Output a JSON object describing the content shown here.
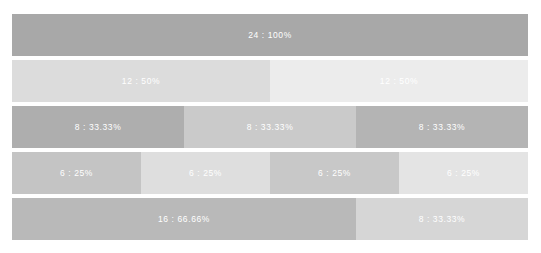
{
  "chart_data": {
    "type": "bar",
    "title": "",
    "subtitle": "",
    "xlabel": "",
    "ylabel": "",
    "orientation": "horizontal",
    "layout": "stacked-fraction-rows",
    "grid": false,
    "legend": null,
    "whole_value": 24,
    "background_color": "#ffffff",
    "label_color": "#ffffff",
    "row_gap_px": 4,
    "rows": [
      {
        "row_index": 0,
        "denominator": 1,
        "segments": [
          {
            "label": "24 : 100%",
            "value": 24,
            "percent": 100,
            "fraction": 1,
            "color": "#a8a8a8"
          }
        ]
      },
      {
        "row_index": 1,
        "denominator": 2,
        "segments": [
          {
            "label": "12 : 50%",
            "value": 12,
            "percent": 50,
            "fraction": 0.5,
            "color": "#dcdcdc"
          },
          {
            "label": "12 : 50%",
            "value": 12,
            "percent": 50,
            "fraction": 0.5,
            "color": "#ececec"
          }
        ]
      },
      {
        "row_index": 2,
        "denominator": 3,
        "segments": [
          {
            "label": "8 : 33.33%",
            "value": 8,
            "percent": 33.33,
            "fraction": 0.3333,
            "color": "#aeaeae"
          },
          {
            "label": "8 : 33.33%",
            "value": 8,
            "percent": 33.33,
            "fraction": 0.3333,
            "color": "#cacaca"
          },
          {
            "label": "8 : 33.33%",
            "value": 8,
            "percent": 33.33,
            "fraction": 0.3333,
            "color": "#b4b4b4"
          }
        ]
      },
      {
        "row_index": 3,
        "denominator": 4,
        "segments": [
          {
            "label": "6 : 25%",
            "value": 6,
            "percent": 25,
            "fraction": 0.25,
            "color": "#c4c4c4"
          },
          {
            "label": "6 : 25%",
            "value": 6,
            "percent": 25,
            "fraction": 0.25,
            "color": "#dedede"
          },
          {
            "label": "6 : 25%",
            "value": 6,
            "percent": 25,
            "fraction": 0.25,
            "color": "#c8c8c8"
          },
          {
            "label": "6 : 25%",
            "value": 6,
            "percent": 25,
            "fraction": 0.25,
            "color": "#e4e4e4"
          }
        ]
      },
      {
        "row_index": 4,
        "denominator": 3,
        "segments": [
          {
            "label": "16 : 66.66%",
            "value": 16,
            "percent": 66.66,
            "fraction": 0.6666,
            "color": "#b9b9b9"
          },
          {
            "label": "8 : 33.33%",
            "value": 8,
            "percent": 33.33,
            "fraction": 0.3333,
            "color": "#d6d6d6"
          }
        ]
      }
    ]
  }
}
